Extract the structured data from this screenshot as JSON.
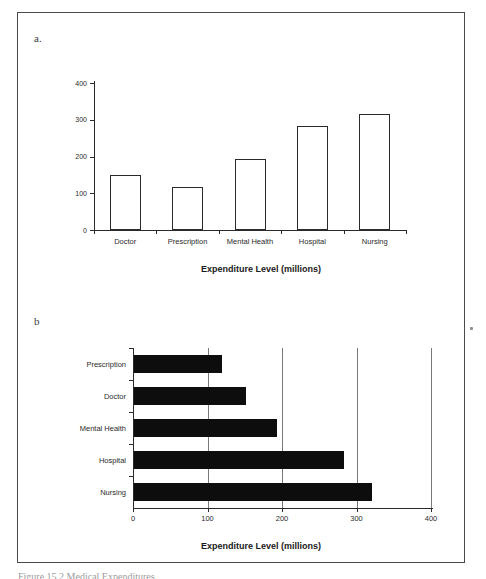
{
  "figure": {
    "panel_a_letter": "a.",
    "panel_b_letter": "b",
    "caption": "Figure   15.2   Medical Expenditures."
  },
  "chart_data": [
    {
      "id": "panel-a",
      "type": "bar",
      "title": "",
      "xlabel": "Expenditure Level (millions)",
      "ylabel": "",
      "categories": [
        "Doctor",
        "Prescription",
        "Mental Health",
        "Hospital",
        "Nursing"
      ],
      "values": [
        150,
        118,
        192,
        282,
        315
      ],
      "ylim": [
        0,
        400
      ],
      "yticks": [
        0,
        100,
        200,
        300,
        400
      ],
      "ytick_labels": [
        "0",
        "100",
        "200",
        "300",
        "400"
      ],
      "grid": false,
      "legend": "none",
      "orientation": "vertical",
      "bar_style": "outline"
    },
    {
      "id": "panel-b",
      "type": "bar",
      "title": "",
      "xlabel": "Expenditure Level (millions)",
      "ylabel": "",
      "categories": [
        "Prescription",
        "Doctor",
        "Mental Health",
        "Hospital",
        "Nursing"
      ],
      "values": [
        118,
        150,
        192,
        282,
        320
      ],
      "xlim": [
        0,
        400
      ],
      "xticks": [
        0,
        100,
        200,
        300,
        400
      ],
      "xtick_labels": [
        "0",
        "100",
        "200",
        "300",
        "400"
      ],
      "grid": true,
      "legend": "none",
      "orientation": "horizontal",
      "bar_style": "filled",
      "bar_color": "#0d0d0d"
    }
  ]
}
